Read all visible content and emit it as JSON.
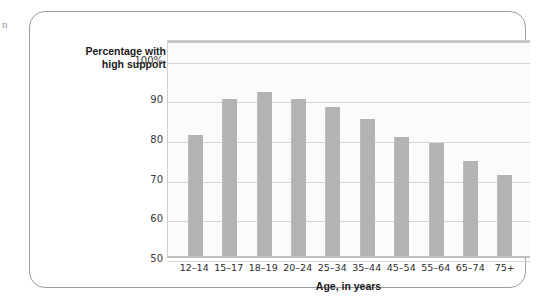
{
  "figure": {
    "margin_artifact": "n"
  },
  "chart_data": {
    "type": "bar",
    "title": "",
    "xlabel": "Age, in years",
    "ylabel": "Percentage with high support",
    "ylabel_line1": "Percentage with",
    "ylabel_line2": "high support",
    "categories": [
      "12–14",
      "15–17",
      "18–19",
      "20–24",
      "25–34",
      "35–44",
      "45–54",
      "55–64",
      "65–74",
      "75+"
    ],
    "values": [
      81,
      90,
      92,
      90,
      88,
      85,
      80.5,
      79,
      74.5,
      71
    ],
    "ylim": [
      50,
      105
    ],
    "ytick_values": [
      100,
      90,
      80,
      70,
      60,
      50
    ],
    "ytick_labels": [
      "100%",
      "90",
      "80",
      "70",
      "60",
      "50"
    ],
    "grid": true,
    "legend": "none",
    "bar_color": "#b3b3b3",
    "gridline_color": "#d4d4d4",
    "plot_background": "#fbfbfb",
    "card_border_color": "#9e9e9e"
  }
}
